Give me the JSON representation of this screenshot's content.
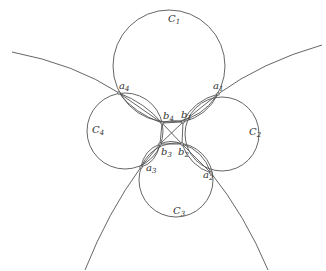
{
  "diagram": {
    "type": "geometric-figure",
    "stroke_color": "#555555",
    "background": "#ffffff",
    "circles": [
      {
        "id": "C1",
        "label": "C",
        "sub": "1",
        "cx": 169,
        "cy": 66,
        "r": 56
      },
      {
        "id": "C2",
        "label": "C",
        "sub": "2",
        "cx": 222,
        "cy": 134,
        "r": 37
      },
      {
        "id": "C3",
        "label": "C",
        "sub": "3",
        "cx": 176,
        "cy": 180,
        "r": 37
      },
      {
        "id": "C4",
        "label": "C",
        "sub": "4",
        "cx": 125,
        "cy": 131,
        "r": 38
      }
    ],
    "points": [
      {
        "id": "a1",
        "label": "a",
        "sub": "1",
        "x": 218,
        "y": 94
      },
      {
        "id": "a2",
        "label": "a",
        "sub": "2",
        "x": 211,
        "y": 173
      },
      {
        "id": "a3",
        "label": "a",
        "sub": "3",
        "x": 141,
        "y": 167
      },
      {
        "id": "a4",
        "label": "a",
        "sub": "4",
        "x": 119,
        "y": 93
      },
      {
        "id": "b1",
        "label": "b",
        "sub": "1",
        "x": 183,
        "y": 122
      },
      {
        "id": "b2",
        "label": "b",
        "sub": "2",
        "x": 182,
        "y": 144
      },
      {
        "id": "b3",
        "label": "b",
        "sub": "3",
        "x": 160,
        "y": 144
      },
      {
        "id": "b4",
        "label": "b",
        "sub": "4",
        "x": 162,
        "y": 123
      }
    ],
    "labels": {
      "C1": {
        "base": "C",
        "sub": "1"
      },
      "C2": {
        "base": "C",
        "sub": "2"
      },
      "C3": {
        "base": "C",
        "sub": "3"
      },
      "C4": {
        "base": "C",
        "sub": "4"
      },
      "a1": {
        "base": "a",
        "sub": "1"
      },
      "a2": {
        "base": "a",
        "sub": "2"
      },
      "a3": {
        "base": "a",
        "sub": "3"
      },
      "a4": {
        "base": "a",
        "sub": "4"
      },
      "b1": {
        "base": "b",
        "sub": "1"
      },
      "b2": {
        "base": "b",
        "sub": "2"
      },
      "b3": {
        "base": "b",
        "sub": "3"
      },
      "b4": {
        "base": "b",
        "sub": "4"
      }
    },
    "outer_curves": [
      {
        "id": "upper-left",
        "from": "a4",
        "to_edge": [
          12,
          52
        ]
      },
      {
        "id": "upper-right",
        "from": "a1",
        "to_edge": [
          322,
          45
        ]
      },
      {
        "id": "lower-left",
        "from": "a3",
        "to_edge": [
          85,
          270
        ]
      },
      {
        "id": "lower-right",
        "from": "a2",
        "to_edge": [
          268,
          270
        ]
      }
    ],
    "center_quadrilateral": [
      "b1",
      "b2",
      "b3",
      "b4"
    ],
    "diagonals": [
      [
        "b1",
        "b3"
      ],
      [
        "b2",
        "b4"
      ]
    ]
  }
}
